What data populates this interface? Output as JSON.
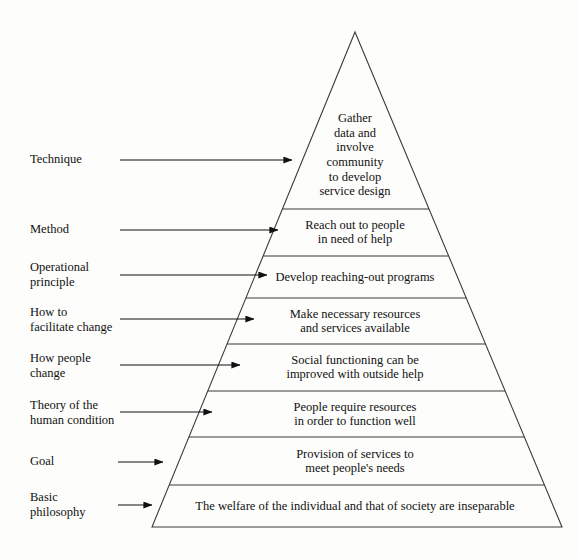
{
  "diagram": {
    "background_color": "#fdfdfb",
    "line_color": "#3a3a3a",
    "text_color": "#111111",
    "apex": {
      "x": 355,
      "y": 32
    },
    "base": {
      "left_x": 152,
      "right_x": 562,
      "y": 527
    },
    "tiers": [
      {
        "id": "tier-technique",
        "label": "Technique",
        "text": "Gather\ndata and\ninvolve\ncommunity\nto develop\nservice design",
        "top_y": 32,
        "bottom_y": 209,
        "text_center_x": 355,
        "text_center_y": 155,
        "arrow": {
          "start_x": 120,
          "end_x": 292,
          "y": 160
        },
        "label_x": 30,
        "label_y": 152
      },
      {
        "id": "tier-method",
        "label": "Method",
        "text": "Reach out to people\nin need of help",
        "top_y": 209,
        "bottom_y": 256,
        "text_center_x": 355,
        "text_center_y": 232,
        "arrow": {
          "start_x": 120,
          "end_x": 278,
          "y": 230
        },
        "label_x": 30,
        "label_y": 222
      },
      {
        "id": "tier-operational-principle",
        "label": "Operational\nprinciple",
        "text": "Develop reaching-out programs",
        "top_y": 256,
        "bottom_y": 298,
        "text_center_x": 355,
        "text_center_y": 277,
        "arrow": {
          "start_x": 120,
          "end_x": 267,
          "y": 275
        },
        "label_x": 30,
        "label_y": 260
      },
      {
        "id": "tier-facilitate-change",
        "label": "How to\nfacilitate change",
        "text": "Make necessary resources\nand services available",
        "top_y": 298,
        "bottom_y": 344,
        "text_center_x": 355,
        "text_center_y": 321,
        "arrow": {
          "start_x": 120,
          "end_x": 254,
          "y": 319
        },
        "label_x": 30,
        "label_y": 305
      },
      {
        "id": "tier-how-people-change",
        "label": "How people\nchange",
        "text": "Social functioning can be\nimproved with outside help",
        "top_y": 344,
        "bottom_y": 391,
        "text_center_x": 355,
        "text_center_y": 367,
        "arrow": {
          "start_x": 120,
          "end_x": 240,
          "y": 365
        },
        "label_x": 30,
        "label_y": 351
      },
      {
        "id": "tier-theory-human-condition",
        "label": "Theory of the\nhuman condition",
        "text": "People require resources\nin order to function well",
        "top_y": 391,
        "bottom_y": 437,
        "text_center_x": 355,
        "text_center_y": 414,
        "arrow": {
          "start_x": 120,
          "end_x": 212,
          "y": 412
        },
        "label_x": 30,
        "label_y": 398
      },
      {
        "id": "tier-goal",
        "label": "Goal",
        "text": "Provision of services to\nmeet people's needs",
        "top_y": 437,
        "bottom_y": 485,
        "text_center_x": 355,
        "text_center_y": 461,
        "arrow": {
          "start_x": 118,
          "end_x": 163,
          "y": 462
        },
        "label_x": 30,
        "label_y": 454
      },
      {
        "id": "tier-basic-philosophy",
        "label": "Basic\nphilosophy",
        "text": "The welfare of the individual and that of society are inseparable",
        "top_y": 485,
        "bottom_y": 527,
        "text_center_x": 355,
        "text_center_y": 506,
        "arrow": {
          "start_x": 118,
          "end_x": 152,
          "y": 505
        },
        "label_x": 30,
        "label_y": 490
      }
    ]
  }
}
